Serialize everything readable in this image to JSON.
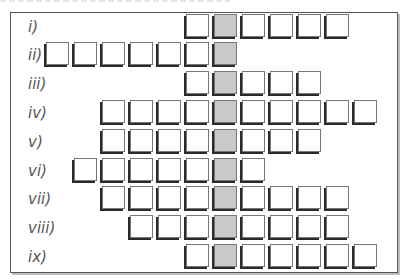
{
  "diagram": {
    "type": "grid-rows",
    "highlight_column": 6,
    "column_pitch_px": 28,
    "first_column_x_px": 46,
    "colors": {
      "cell_fill": "#ffffff",
      "highlight_fill": "#c9c9c9",
      "cell_border": "#777777",
      "cell_shadow": "#2a2a2a",
      "label_text": "#555555",
      "frame_border": "#555555"
    },
    "rows": [
      {
        "label": "i)",
        "start_col": 5,
        "end_col": 10
      },
      {
        "label": "ii)",
        "start_col": 0,
        "end_col": 6
      },
      {
        "label": "iii)",
        "start_col": 5,
        "end_col": 9
      },
      {
        "label": "iv)",
        "start_col": 2,
        "end_col": 11
      },
      {
        "label": "v)",
        "start_col": 2,
        "end_col": 9
      },
      {
        "label": "vi)",
        "start_col": 1,
        "end_col": 7
      },
      {
        "label": "vii)",
        "start_col": 2,
        "end_col": 10
      },
      {
        "label": "viii)",
        "start_col": 3,
        "end_col": 10
      },
      {
        "label": "ix)",
        "start_col": 5,
        "end_col": 11
      }
    ]
  }
}
